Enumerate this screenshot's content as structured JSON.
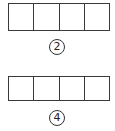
{
  "figures": [
    {
      "label": "2",
      "cells": 4
    },
    {
      "label": "4",
      "cells": 4
    }
  ],
  "colors": {
    "line": "#3a3a3a",
    "background": "#ffffff"
  }
}
